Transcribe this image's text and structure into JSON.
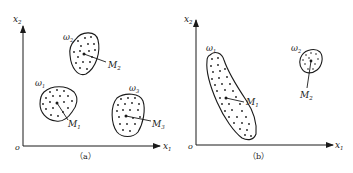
{
  "figure": {
    "panels": [
      {
        "id": "a",
        "caption": "（a）",
        "axes": {
          "origin": "o",
          "x_label": "x",
          "x_sub": "1",
          "y_label": "x",
          "y_sub": "2"
        },
        "clusters": [
          {
            "class_label": "ω",
            "class_sub": "2",
            "center_label": "M",
            "center_sub": "2"
          },
          {
            "class_label": "ω",
            "class_sub": "1",
            "center_label": "M",
            "center_sub": "1"
          },
          {
            "class_label": "ω",
            "class_sub": "3",
            "center_label": "M",
            "center_sub": "3"
          }
        ]
      },
      {
        "id": "b",
        "caption": "（b）",
        "axes": {
          "origin": "o",
          "x_label": "x",
          "x_sub": "1",
          "y_label": "x",
          "y_sub": "2"
        },
        "clusters": [
          {
            "class_label": "ω",
            "class_sub": "1",
            "center_label": "M",
            "center_sub": "1"
          },
          {
            "class_label": "ω",
            "class_sub": "2",
            "center_label": "M",
            "center_sub": "2"
          }
        ]
      }
    ],
    "colors": {
      "ink": "#1a1a1a",
      "background": "#ffffff"
    }
  }
}
